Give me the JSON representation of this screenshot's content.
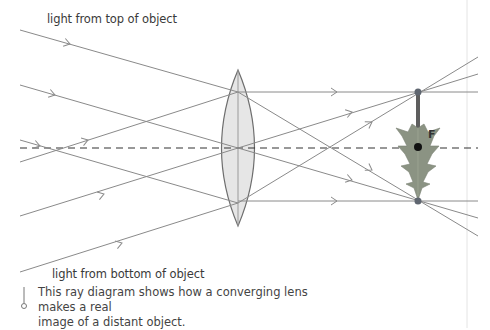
{
  "labels": {
    "top": "light from top of object",
    "bottom": "light from bottom of object",
    "focal_point": "F"
  },
  "caption": {
    "line1": "This ray diagram shows how a converging lens makes a real",
    "line2": "image of a distant object."
  },
  "diagram": {
    "type": "ray-diagram",
    "lens": "converging lens",
    "principal_axis": "dashed",
    "image": "inverted tree (real image)",
    "colors": {
      "ray": "#8a8a8a",
      "lens_fill": "#e6e6e6",
      "lens_stroke": "#6e6e6e",
      "axis": "#333333",
      "image_tree": "#8b9383",
      "focal_dot": "#111111",
      "image_point": "#5f6670"
    }
  }
}
